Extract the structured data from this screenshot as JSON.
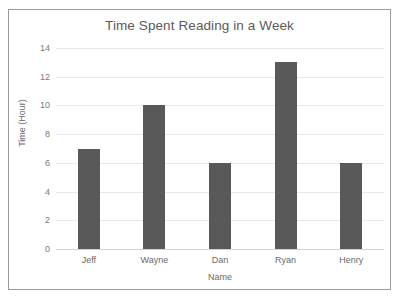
{
  "chart_data": {
    "type": "bar",
    "title": "Time Spent Reading in a Week",
    "xlabel": "Name",
    "ylabel": "Time (Hour)",
    "categories": [
      "Jeff",
      "Wayne",
      "Dan",
      "Ryan",
      "Henry"
    ],
    "values": [
      7,
      10,
      6,
      13,
      6
    ],
    "yticks": [
      0,
      2,
      4,
      6,
      8,
      10,
      12,
      14
    ],
    "ylim": [
      0,
      14
    ],
    "grid": true,
    "legend": false,
    "bar_color": "#595959",
    "gridline_color": "#e9e9e9",
    "text_color": "#5a5a5a",
    "border_color": "#9b9b9b",
    "background": "#ffffff"
  }
}
